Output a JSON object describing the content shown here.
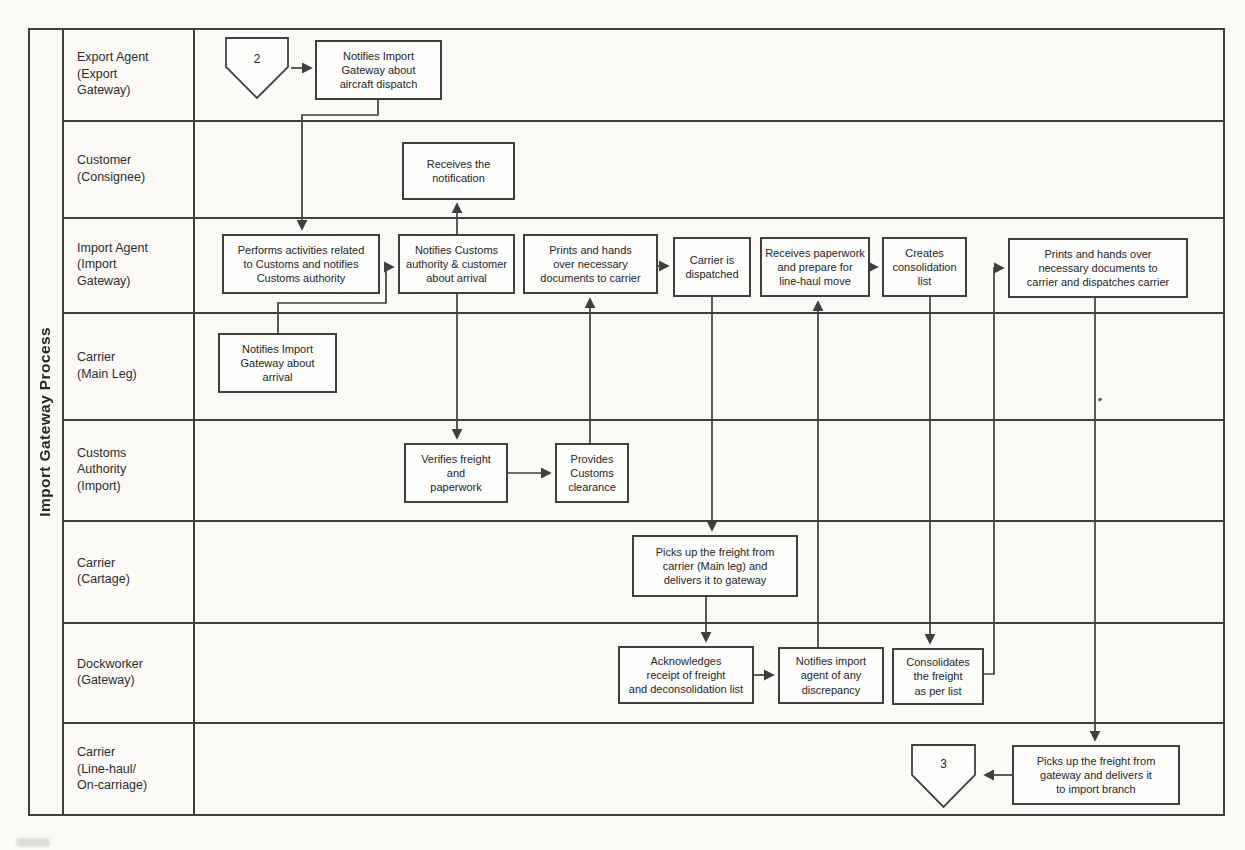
{
  "title": "Import Gateway Process",
  "appearance": {
    "ink": "#2f2f2f",
    "line": "#3f3f3f",
    "paper": "#fbfaf7",
    "node_fill": "#fdfdfc"
  },
  "lanes": [
    {
      "label": "Export Agent\n(Export\nGateway)"
    },
    {
      "label": "Customer\n(Consignee)"
    },
    {
      "label": "Import Agent\n(Import\nGateway)"
    },
    {
      "label": "Carrier\n(Main Leg)"
    },
    {
      "label": "Customs\nAuthority\n(Import)"
    },
    {
      "label": "Carrier\n(Cartage)"
    },
    {
      "label": "Dockworker\n(Gateway)"
    },
    {
      "label": "Carrier\n(Line-haul/\nOn-carriage)"
    }
  ],
  "off_page_connectors": {
    "incoming_label": "2",
    "outgoing_label": "3"
  },
  "nodes": {
    "notify_aircraft_dispatch": "Notifies Import\nGateway about\naircraft dispatch",
    "receives_notification": "Receives the\nnotification",
    "performs_customs_activities": "Performs activities related\nto Customs and notifies\nCustoms authority",
    "notifies_customs_customer": "Notifies Customs\nauthority & customer\nabout arrival",
    "prints_hands_docs_carrier": "Prints and hands\nover necessary\ndocuments to carrier",
    "carrier_dispatched": "Carrier is\ndispatched",
    "receives_paperwork": "Receives paperwork\nand prepare for\nline-haul move",
    "creates_consolidation_list": "Creates\nconsolidation\nlist",
    "prints_dispatches_carrier": "Prints and hands over\nnecessary documents to\ncarrier and dispatches carrier",
    "notifies_arrival": "Notifies Import\nGateway about\narrival",
    "verifies_freight": "Verifies freight\nand\npaperwork",
    "provides_clearance": "Provides\nCustoms\nclearance",
    "picks_up_main_leg": "Picks up the freight from\ncarrier (Main leg) and\ndelivers it to gateway",
    "acknowledges_receipt": "Acknowledges\nreceipt of freight\nand deconsolidation list",
    "notifies_discrepancy": "Notifies import\nagent of any\ndiscrepancy",
    "consolidates_freight": "Consolidates\nthe freight\nas per list",
    "picks_up_gateway": "Picks up the freight from\ngateway and delivers it\nto import branch"
  }
}
